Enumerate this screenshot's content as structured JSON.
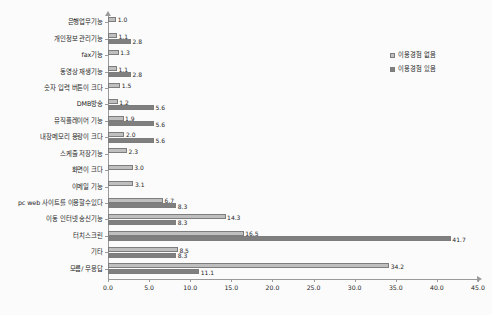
{
  "chart_data": {
    "type": "bar",
    "orientation": "horizontal",
    "title": "",
    "xlabel": "",
    "ylabel": "",
    "xlim": [
      0.0,
      45.0
    ],
    "xticks": [
      "0.0",
      "5.0",
      "10.0",
      "15.0",
      "20.0",
      "25.0",
      "30.0",
      "35.0",
      "40.0",
      "45.0"
    ],
    "grid": false,
    "legend_position": "top-right",
    "categories": [
      "은행업무기능",
      "개인정보 관리기능",
      "fax기능",
      "동영상 재생기능",
      "숫자 입력 버튼이 크다",
      "DMB방송",
      "뮤직플레이어 기능",
      "내장메모리 용량이 크다",
      "스케줄 저장기능",
      "화면이 크다",
      "이메일 기능",
      "pc web 사이트를 이용할수있다",
      "이동 인터넷 송신기능",
      "터치스크린",
      "기타",
      "모름/ 무응답"
    ],
    "series": [
      {
        "name": "이용경험 없음",
        "color": "#bfbfbf",
        "values": [
          1.0,
          1.1,
          1.3,
          1.1,
          1.5,
          1.2,
          1.9,
          2.0,
          2.3,
          3.0,
          3.1,
          6.7,
          14.3,
          16.5,
          8.5,
          34.2
        ]
      },
      {
        "name": "이용경험 있음",
        "color": "#7f7f7f",
        "values": [
          0.0,
          2.8,
          0.0,
          2.8,
          0.0,
          5.6,
          5.6,
          5.6,
          0.0,
          0.0,
          0.0,
          8.3,
          8.3,
          41.7,
          8.3,
          11.1
        ]
      }
    ],
    "value_labels": [
      {
        "category": "은행업무기능",
        "series0": "1.0",
        "series1": ""
      },
      {
        "category": "개인정보 관리기능",
        "series0": "1.1",
        "series1": "2.8"
      },
      {
        "category": "fax기능",
        "series0": "1.3",
        "series1": ""
      },
      {
        "category": "동영상 재생기능",
        "series0": "1.1",
        "series1": "2.8"
      },
      {
        "category": "숫자 입력 버튼이 크다",
        "series0": "1.5",
        "series1": ""
      },
      {
        "category": "DMB방송",
        "series0": "1.2",
        "series1": "5.6"
      },
      {
        "category": "뮤직플레이어 기능",
        "series0": "1.9",
        "series1": "5.6"
      },
      {
        "category": "내장메모리 용량이 크다",
        "series0": "2.0",
        "series1": "5.6"
      },
      {
        "category": "스케줄 저장기능",
        "series0": "2.3",
        "series1": ""
      },
      {
        "category": "화면이 크다",
        "series0": "3.0",
        "series1": ""
      },
      {
        "category": "이메일 기능",
        "series0": "3.1",
        "series1": ""
      },
      {
        "category": "pc web 사이트를 이용할수있다",
        "series0": "6.7",
        "series1": "8.3"
      },
      {
        "category": "이동 인터넷 송신기능",
        "series0": "14.3",
        "series1": "8.3"
      },
      {
        "category": "터치스크린",
        "series0": "16.5",
        "series1": "41.7"
      },
      {
        "category": "기타",
        "series0": "8.5",
        "series1": "8.3"
      },
      {
        "category": "모름/ 무응답",
        "series0": "34.2",
        "series1": "11.1"
      }
    ]
  },
  "legend": {
    "items": [
      {
        "label": "이용경험 없음",
        "color": "#bfbfbf"
      },
      {
        "label": "이용경험 있음",
        "color": "#7f7f7f"
      }
    ]
  }
}
